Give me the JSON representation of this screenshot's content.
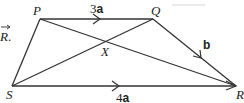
{
  "diagram": {
    "type": "trapezium-vector-diagram",
    "vertices": {
      "P": {
        "label": "P"
      },
      "Q": {
        "label": "Q"
      },
      "R": {
        "label": "R"
      },
      "S": {
        "label": "S"
      },
      "X": {
        "label": "X"
      }
    },
    "edges": [
      {
        "from": "P",
        "to": "Q",
        "vector_coef": "3",
        "vector_sym": "a",
        "directed": true
      },
      {
        "from": "Q",
        "to": "R",
        "vector_coef": "",
        "vector_sym": "b",
        "directed": true
      },
      {
        "from": "S",
        "to": "R",
        "vector_coef": "4",
        "vector_sym": "a",
        "directed": true
      },
      {
        "from": "P",
        "to": "S",
        "directed": false
      },
      {
        "from": "P",
        "to": "R",
        "directed": false,
        "diagonal": true
      },
      {
        "from": "S",
        "to": "Q",
        "directed": false,
        "diagonal": true
      }
    ],
    "intersection": "X",
    "partial_text": {
      "arrow_over": "R",
      "suffix": "."
    },
    "colors": {
      "line": "#333333",
      "text": "#222222",
      "background": "#ffffff"
    }
  }
}
